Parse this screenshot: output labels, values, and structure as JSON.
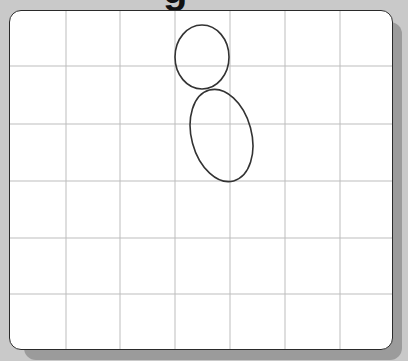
{
  "title": {
    "visible_fragment": "g"
  },
  "grid": {
    "columns": 7,
    "rows": 6,
    "vertical_lines_x": [
      56,
      110,
      165,
      220,
      275,
      330
    ],
    "horizontal_lines_y": [
      55,
      113,
      170,
      227,
      283
    ],
    "line_color": "#bdbdbd"
  },
  "shapes": [
    {
      "type": "ellipse",
      "name": "upper-ellipse",
      "cx": 192,
      "cy": 46,
      "rx": 27,
      "ry": 32,
      "rotate": 0,
      "stroke": "#333333"
    },
    {
      "type": "ellipse",
      "name": "lower-ellipse",
      "cx": 211.5,
      "cy": 124.5,
      "rx": 30,
      "ry": 47,
      "rotate": -15,
      "stroke": "#333333"
    }
  ],
  "colors": {
    "background": "#c9c9c9",
    "shadow": "#9b9b9b",
    "panel": "#ffffff",
    "border": "#2a2a2a"
  }
}
